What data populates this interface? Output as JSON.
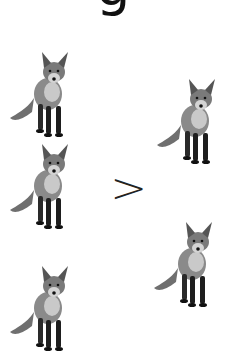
{
  "title": {
    "visible_fragment": "g"
  },
  "comparison": {
    "symbol": ">"
  },
  "left_group": {
    "label": "group-left",
    "count": 3,
    "items": [
      {
        "name": "fox",
        "icon": "fox-icon"
      },
      {
        "name": "fox",
        "icon": "fox-icon"
      },
      {
        "name": "fox",
        "icon": "fox-icon"
      }
    ]
  },
  "right_group": {
    "label": "group-right",
    "count": 2,
    "items": [
      {
        "name": "fox",
        "icon": "fox-icon"
      },
      {
        "name": "fox",
        "icon": "fox-icon"
      }
    ]
  },
  "colors": {
    "background": "#ffffff",
    "fox_fur": "#8a8a8a",
    "fox_dark": "#1e1e1e",
    "symbol": "#222222"
  }
}
